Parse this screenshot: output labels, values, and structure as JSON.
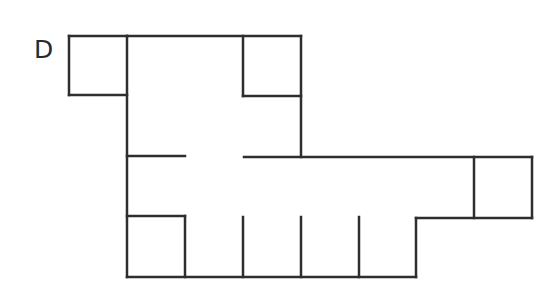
{
  "diagram": {
    "label": "D",
    "stroke_color": "#2e2e2e",
    "background": "#ffffff",
    "stroke_width": 2.5,
    "walls": [
      {
        "id": "top-left-box-top",
        "x1": 69,
        "y1": 36,
        "x2": 127,
        "y2": 36
      },
      {
        "id": "top-left-box-left",
        "x1": 69,
        "y1": 36,
        "x2": 69,
        "y2": 95
      },
      {
        "id": "top-left-box-bottom",
        "x1": 69,
        "y1": 95,
        "x2": 127,
        "y2": 95
      },
      {
        "id": "main-top",
        "x1": 127,
        "y1": 36,
        "x2": 301,
        "y2": 36
      },
      {
        "id": "main-left-wall",
        "x1": 127,
        "y1": 36,
        "x2": 127,
        "y2": 277
      },
      {
        "id": "top-right-box-left",
        "x1": 243,
        "y1": 36,
        "x2": 243,
        "y2": 96
      },
      {
        "id": "top-right-box-bottom",
        "x1": 243,
        "y1": 96,
        "x2": 301,
        "y2": 96
      },
      {
        "id": "main-right-wall-upper",
        "x1": 301,
        "y1": 36,
        "x2": 301,
        "y2": 157
      },
      {
        "id": "corridor-wall-left-segment",
        "x1": 127,
        "y1": 156,
        "x2": 185,
        "y2": 156
      },
      {
        "id": "corridor-wall-right-segment",
        "x1": 244,
        "y1": 157,
        "x2": 532,
        "y2": 157
      },
      {
        "id": "right-box-left",
        "x1": 474,
        "y1": 157,
        "x2": 474,
        "y2": 218
      },
      {
        "id": "right-box-right",
        "x1": 532,
        "y1": 157,
        "x2": 532,
        "y2": 218
      },
      {
        "id": "right-box-bottom-step",
        "x1": 416,
        "y1": 218,
        "x2": 532,
        "y2": 218
      },
      {
        "id": "step-vertical",
        "x1": 416,
        "y1": 218,
        "x2": 416,
        "y2": 277
      },
      {
        "id": "main-bottom",
        "x1": 127,
        "y1": 277,
        "x2": 416,
        "y2": 277
      },
      {
        "id": "bottom-left-box-top",
        "x1": 127,
        "y1": 216,
        "x2": 185,
        "y2": 216
      },
      {
        "id": "bottom-left-box-right",
        "x1": 185,
        "y1": 216,
        "x2": 185,
        "y2": 277
      },
      {
        "id": "divider-1",
        "x1": 243,
        "y1": 217,
        "x2": 243,
        "y2": 277
      },
      {
        "id": "divider-2",
        "x1": 301,
        "y1": 217,
        "x2": 301,
        "y2": 277
      },
      {
        "id": "divider-3",
        "x1": 359,
        "y1": 217,
        "x2": 359,
        "y2": 277
      }
    ]
  }
}
